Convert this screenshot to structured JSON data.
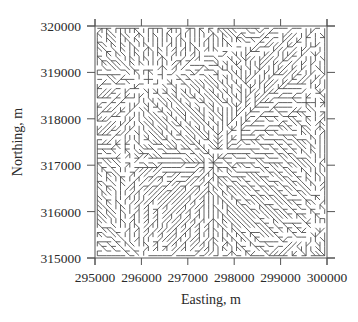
{
  "chart_data": {
    "type": "diagram-network",
    "title": "",
    "xlabel": "Easting, m",
    "ylabel": "Northing, m",
    "xlim": [
      295000,
      300000
    ],
    "ylim": [
      315000,
      320000
    ],
    "x_ticks": [
      295000,
      296000,
      297000,
      298000,
      299000,
      300000
    ],
    "y_ticks": [
      315000,
      316000,
      317000,
      318000,
      319000,
      320000
    ],
    "x_tick_labels": [
      "295000",
      "296000",
      "297000",
      "298000",
      "299000",
      "300000"
    ],
    "y_tick_labels": [
      "315000",
      "316000",
      "317000",
      "318000",
      "319000",
      "320000"
    ],
    "grid": false,
    "legend": null,
    "cell_size_m": 100,
    "grid_cells": [
      50,
      50
    ],
    "line_color": "#3a3a3a"
  },
  "layout": {
    "plot_left": 95,
    "plot_right": 327,
    "plot_top": 26,
    "plot_bottom": 258
  }
}
